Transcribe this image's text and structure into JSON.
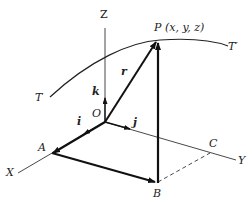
{
  "diagram": {
    "title": "",
    "labels": {
      "Z": "Z",
      "X": "X",
      "Y": "Y",
      "O": "O",
      "P": "P (x, y, z)",
      "T": "T",
      "T_prime": "T′",
      "A": "A",
      "B": "B",
      "C": "C",
      "i": "i",
      "j": "j",
      "k": "k",
      "r": "r"
    },
    "nodes": [
      {
        "id": "O",
        "label": "O",
        "role": "origin"
      },
      {
        "id": "P",
        "label": "P (x, y, z)",
        "role": "point on curve"
      },
      {
        "id": "A",
        "label": "A",
        "role": "point on X axis"
      },
      {
        "id": "B",
        "label": "B",
        "role": "projection in XY plane"
      },
      {
        "id": "C",
        "label": "C",
        "role": "point on Y axis"
      }
    ],
    "edges": [
      {
        "from": "O",
        "to": "Z",
        "style": "thin",
        "label": "Z axis"
      },
      {
        "from": "O",
        "to": "X",
        "style": "thin",
        "label": "X axis"
      },
      {
        "from": "O",
        "to": "Y",
        "style": "thin",
        "label": "Y axis"
      },
      {
        "from": "O",
        "to": "A",
        "style": "bold arrow",
        "label": ""
      },
      {
        "from": "A",
        "to": "B",
        "style": "bold arrow",
        "label": ""
      },
      {
        "from": "B",
        "to": "P",
        "style": "bold arrow",
        "label": ""
      },
      {
        "from": "O",
        "to": "P",
        "style": "bold arrow",
        "label": "r"
      },
      {
        "from": "B",
        "to": "C",
        "style": "dashed",
        "label": ""
      },
      {
        "from": "O",
        "to": "k",
        "style": "unit vector",
        "label": "k"
      },
      {
        "from": "O",
        "to": "i",
        "style": "unit vector",
        "label": "i"
      },
      {
        "from": "O",
        "to": "j",
        "style": "unit vector",
        "label": "j"
      },
      {
        "from": "T",
        "to": "T′",
        "style": "curve",
        "label": "space curve"
      }
    ]
  }
}
